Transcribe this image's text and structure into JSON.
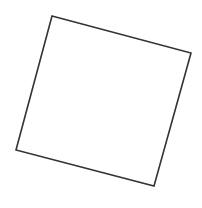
{
  "canvas": {
    "width": 202,
    "height": 208,
    "background": "#ffffff"
  },
  "shapes": [
    {
      "type": "quadrilateral",
      "description": "rotated square outline",
      "points": [
        [
          52,
          16
        ],
        [
          191,
          53
        ],
        [
          154,
          186
        ],
        [
          16,
          150
        ]
      ],
      "stroke": "#333333",
      "stroke_width": 1.6,
      "fill": "none"
    }
  ]
}
